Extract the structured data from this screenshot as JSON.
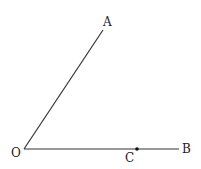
{
  "diagram": {
    "type": "angle",
    "colors": {
      "line": "#333333",
      "label": "#222222",
      "background": "#ffffff"
    },
    "points": {
      "O": {
        "label": "O",
        "x": 24,
        "y": 149
      },
      "A": {
        "label": "A",
        "x": 103,
        "y": 30
      },
      "B": {
        "label": "B",
        "x": 179,
        "y": 149
      },
      "C": {
        "label": "C",
        "x": 137,
        "y": 149
      }
    },
    "segments": [
      {
        "from": "O",
        "to": "A"
      },
      {
        "from": "O",
        "to": "B"
      }
    ]
  }
}
